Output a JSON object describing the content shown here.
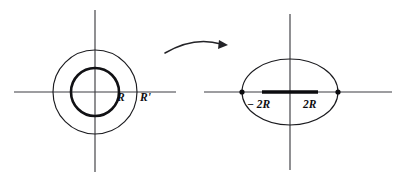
{
  "figure": {
    "title": "Mapping of concentric circles to an ellipse with slit",
    "background_color": "#ffffff",
    "ink_color": "#0d0d10",
    "axis_color": "#3d3d42"
  },
  "left_panel": {
    "name": "domain-plane",
    "center": {
      "x": 95,
      "y": 92
    },
    "axes": {
      "horizontal": {
        "x1": 14,
        "x2": 176,
        "y": 92
      },
      "vertical": {
        "x": 95,
        "y1": 10,
        "y2": 172
      }
    },
    "inner_circle": {
      "radius": 24,
      "stroke_weight": "thick",
      "label": "R",
      "label_x": 121,
      "label_y": 101
    },
    "outer_circle": {
      "radius": 42,
      "stroke_weight": "thin",
      "label": "R'",
      "label_x": 144,
      "label_y": 101
    }
  },
  "arrow": {
    "name": "transform-arrow",
    "direction": "right",
    "start": {
      "x": 165,
      "y": 53
    },
    "end": {
      "x": 224,
      "y": 44
    },
    "control": {
      "x": 193,
      "y": 38
    }
  },
  "right_panel": {
    "name": "image-plane",
    "center": {
      "x": 290,
      "y": 92
    },
    "axes": {
      "horizontal": {
        "x1": 204,
        "x2": 392,
        "y": 92
      },
      "vertical": {
        "x": 290,
        "y1": 14,
        "y2": 170
      }
    },
    "ellipse": {
      "rx": 48,
      "ry": 33,
      "stroke_weight": "thin"
    },
    "slit_segment": {
      "x1": 262,
      "x2": 318,
      "y": 92,
      "stroke_weight": "very-thick"
    },
    "vertices": [
      {
        "x": 242,
        "y": 92
      },
      {
        "x": 338,
        "y": 92
      }
    ],
    "labels": [
      {
        "text": "− 2R",
        "x": 250,
        "y": 107
      },
      {
        "text": "2R",
        "x": 306,
        "y": 107
      }
    ]
  }
}
